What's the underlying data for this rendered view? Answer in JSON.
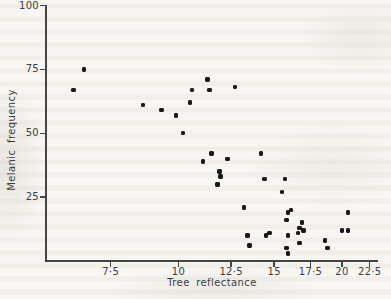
{
  "figure": {
    "paper_color": "#f8f6f2",
    "axis_color": "#454545",
    "text_color": "#3d3d3d",
    "point_color": "#191919"
  },
  "chart_data": {
    "type": "scatter",
    "title": "",
    "xlabel": "Tree reflectance",
    "ylabel": "Melanic frequency",
    "x_scale": "log",
    "y_scale": "linear",
    "xlim": [
      5.7,
      23.3
    ],
    "ylim": [
      0,
      100
    ],
    "grid": false,
    "legend": null,
    "x_ticks": [
      {
        "value": 7.5,
        "label": "7·5"
      },
      {
        "value": 10,
        "label": "10"
      },
      {
        "value": 12.5,
        "label": "12·5"
      },
      {
        "value": 15,
        "label": "15"
      },
      {
        "value": 17.5,
        "label": "17·5"
      },
      {
        "value": 20,
        "label": "20"
      },
      {
        "value": 22.5,
        "label": "22·5"
      }
    ],
    "y_ticks": [
      {
        "value": 25,
        "label": "25"
      },
      {
        "value": 50,
        "label": "50"
      },
      {
        "value": 75,
        "label": "75"
      },
      {
        "value": 100,
        "label": "100"
      }
    ],
    "points": [
      [
        6.4,
        67
      ],
      [
        6.7,
        75
      ],
      [
        8.6,
        61
      ],
      [
        9.3,
        59
      ],
      [
        9.9,
        57
      ],
      [
        10.2,
        50
      ],
      [
        10.5,
        62
      ],
      [
        10.6,
        67
      ],
      [
        11.3,
        71
      ],
      [
        11.4,
        67
      ],
      [
        12.7,
        68
      ],
      [
        11.1,
        39
      ],
      [
        11.5,
        42
      ],
      [
        12.3,
        40
      ],
      [
        11.9,
        35
      ],
      [
        11.95,
        33
      ],
      [
        11.8,
        30
      ],
      [
        13.2,
        21
      ],
      [
        13.4,
        10
      ],
      [
        13.5,
        6
      ],
      [
        14.2,
        42
      ],
      [
        14.4,
        32
      ],
      [
        14.5,
        10
      ],
      [
        14.7,
        11
      ],
      [
        15.5,
        27
      ],
      [
        15.7,
        32
      ],
      [
        15.8,
        16
      ],
      [
        15.9,
        19
      ],
      [
        16.1,
        20
      ],
      [
        16.9,
        15
      ],
      [
        16.7,
        13
      ],
      [
        17.0,
        12
      ],
      [
        16.6,
        11
      ],
      [
        15.9,
        10
      ],
      [
        16.7,
        7
      ],
      [
        15.8,
        5
      ],
      [
        15.9,
        3
      ],
      [
        18.6,
        8
      ],
      [
        18.8,
        5
      ],
      [
        20.0,
        12
      ],
      [
        20.5,
        12
      ],
      [
        20.5,
        19
      ]
    ]
  }
}
